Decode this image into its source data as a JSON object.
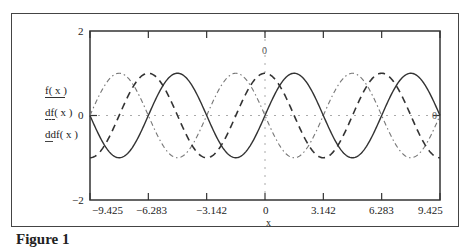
{
  "chart_data": {
    "type": "line",
    "title": "",
    "xlabel": "x",
    "ylabel": "",
    "xlim": [
      -9.425,
      9.425
    ],
    "ylim": [
      -2,
      2
    ],
    "x_ticks": [
      "-9.425",
      "-6.283",
      "-3.142",
      "0",
      "3.142",
      "6.283",
      "9.425"
    ],
    "y_ticks": [
      "2",
      "0",
      "-2"
    ],
    "grid": false,
    "zero_lines": true,
    "legend_position": "left",
    "series": [
      {
        "name": "f(x)",
        "function": "sin(x)",
        "style": "solid",
        "color": "#333333",
        "x": [
          -9.425,
          -7.854,
          -6.283,
          -4.712,
          -3.142,
          -1.571,
          0,
          1.571,
          3.142,
          4.712,
          6.283,
          7.854,
          9.425
        ],
        "values": [
          0,
          -1,
          0,
          1,
          0,
          -1,
          0,
          1,
          0,
          -1,
          0,
          1,
          0
        ]
      },
      {
        "name": "df(x)",
        "function": "cos(x)",
        "style": "dashed",
        "color": "#333333",
        "x": [
          -9.425,
          -7.854,
          -6.283,
          -4.712,
          -3.142,
          -1.571,
          0,
          1.571,
          3.142,
          4.712,
          6.283,
          7.854,
          9.425
        ],
        "values": [
          -1,
          0,
          1,
          0,
          -1,
          0,
          1,
          0,
          -1,
          0,
          1,
          0,
          -1
        ]
      },
      {
        "name": "ddf(x)",
        "function": "-sin(x)",
        "style": "dash-dot",
        "color": "#777777",
        "x": [
          -9.425,
          -7.854,
          -6.283,
          -4.712,
          -3.142,
          -1.571,
          0,
          1.571,
          3.142,
          4.712,
          6.283,
          7.854,
          9.425
        ],
        "values": [
          0,
          1,
          0,
          -1,
          0,
          1,
          0,
          -1,
          0,
          1,
          0,
          -1,
          0
        ]
      }
    ]
  },
  "labels": {
    "y_top": "2",
    "y_zero": "0",
    "y_bottom": "−2",
    "x_ticks": [
      "−9.425",
      "−6.283",
      "−3.142",
      "0",
      "3.142",
      "6.283",
      "9.425"
    ],
    "x_axis_label": "x",
    "top_zero_marker": "0",
    "right_zero_marker": "0",
    "legend": [
      "f( x )",
      "df( x )",
      "ddf( x )"
    ],
    "caption": "Figure 1"
  }
}
